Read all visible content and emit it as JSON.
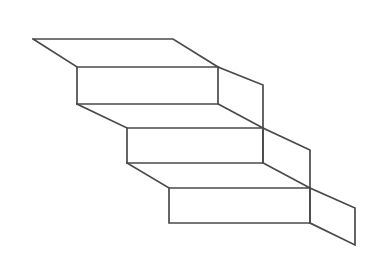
{
  "figure": {
    "type": "line-drawing",
    "background_color": "#ffffff",
    "line_color": "#4a4a4a",
    "line_width": 1.7,
    "canvas": {
      "width": 384,
      "height": 268
    },
    "steps_count": 3,
    "labels": [],
    "geometry": {
      "description": "Three-step staircase drawn in parallel (oblique) projection descending from upper-left to lower-right.",
      "vertices": {
        "top_face_back_left": [
          33,
          39
        ],
        "top_face_back_right": [
          173,
          39
        ],
        "top_face_front_left": [
          77,
          67
        ],
        "top_face_front_right": [
          218,
          67
        ],
        "riser1_bottom_left": [
          77,
          104
        ],
        "riser1_bottom_right": [
          218,
          104
        ],
        "tread2_back_right": [
          263,
          85
        ],
        "tread2_front_right": [
          263,
          128
        ],
        "tread2_back_left": [
          127,
          128
        ],
        "riser2_bottom_left": [
          127,
          163
        ],
        "riser2_bottom_right": [
          263,
          163
        ],
        "tread3_back_right": [
          310,
          150
        ],
        "tread3_front_right": [
          310,
          188
        ],
        "tread3_back_left": [
          169,
          188
        ],
        "riser3_bottom_left": [
          169,
          223
        ],
        "riser3_bottom_right": [
          310,
          223
        ],
        "side_far_top_right": [
          355,
          208
        ],
        "side_far_bottom_right": [
          355,
          245
        ]
      },
      "polylines": [
        {
          "name": "top-tread-outline",
          "points": "33,39 173,39 218,67 77,67 33,39"
        },
        {
          "name": "riser-1",
          "points": "77,67 77,104 218,104 218,67"
        },
        {
          "name": "tread-2-outline",
          "points": "77,104 127,128 263,128 218,104"
        },
        {
          "name": "riser-2",
          "points": "127,128 127,163 263,163 263,128"
        },
        {
          "name": "tread-3-outline",
          "points": "127,163 169,188 310,188 263,163"
        },
        {
          "name": "riser-3",
          "points": "169,188 169,223 310,223 310,188"
        },
        {
          "name": "right-side-edge-upper",
          "points": "218,67 263,85 263,163"
        },
        {
          "name": "right-side-edge-middle",
          "points": "263,128 310,150 310,223"
        },
        {
          "name": "right-side-edge-lower",
          "points": "310,188 355,208 355,245 310,223"
        }
      ]
    }
  }
}
